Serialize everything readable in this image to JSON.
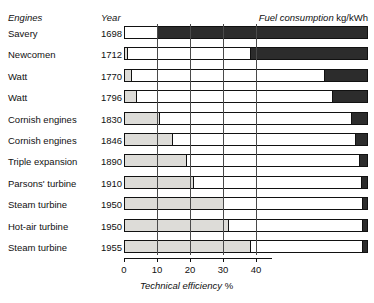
{
  "header": {
    "engines": "Engines",
    "year": "Year",
    "fuel_consumption": "Fuel consumption",
    "fuel_unit": "kg/kWh"
  },
  "axis": {
    "title": "Technical efficiency",
    "title_unit": "%",
    "ticks": [
      0,
      10,
      20,
      30,
      40
    ],
    "min": 0,
    "max": 40
  },
  "chart_data": {
    "type": "bar",
    "orientation": "horizontal",
    "stacked": true,
    "title": "",
    "subtitle": "",
    "xlabel": "Technical efficiency %",
    "ylabel": "Engines",
    "xlim": [
      0,
      74
    ],
    "xticks": [
      0,
      10,
      20,
      30,
      40
    ],
    "grid": true,
    "legend_position": "none",
    "annotations": [
      "Engines",
      "Year",
      "Fuel consumption kg/kWh"
    ],
    "categories": [
      "Savery",
      "Newcomen",
      "Watt",
      "Watt",
      "Cornish engines",
      "Cornish engines",
      "Triple expansion",
      "Parsons' turbine",
      "Steam turbine",
      "Hot-air turbine",
      "Steam turbine"
    ],
    "years": [
      1698,
      1712,
      1770,
      1796,
      1830,
      1846,
      1890,
      1910,
      1950,
      1950,
      1955
    ],
    "series": [
      {
        "name": "Technical efficiency %",
        "color": "#dddcd8",
        "values": [
          0.0,
          0.5,
          2.0,
          3.5,
          10.5,
          14.5,
          19.0,
          21.0,
          30.0,
          31.5,
          38.0
        ]
      },
      {
        "name": "Fuel consumption kg/kWh",
        "color": "#2c2c2c",
        "values": [
          63.0,
          35.0,
          13.0,
          10.5,
          5.5,
          4.5,
          3.0,
          2.0,
          1.5,
          1.5,
          1.5
        ]
      }
    ],
    "bars": [
      {
        "label": "Savery",
        "year": "1698",
        "efficiency": 0.0,
        "efficiency_px": 0,
        "white_end_px": 34,
        "loss_px": 210
      },
      {
        "label": "Newcomen",
        "year": "1712",
        "efficiency": 0.5,
        "efficiency_px": 3,
        "white_end_px": 127,
        "loss_px": 117
      },
      {
        "label": "Watt",
        "year": "1770",
        "efficiency": 2.0,
        "efficiency_px": 7,
        "white_end_px": 201,
        "loss_px": 43
      },
      {
        "label": "Watt",
        "year": "1796",
        "efficiency": 3.5,
        "efficiency_px": 12,
        "white_end_px": 209,
        "loss_px": 35
      },
      {
        "label": "Cornish engines",
        "year": "1830",
        "efficiency": 10.5,
        "efficiency_px": 35,
        "white_end_px": 228,
        "loss_px": 16
      },
      {
        "label": "Cornish engines",
        "year": "1846",
        "efficiency": 14.5,
        "efficiency_px": 48,
        "white_end_px": 232,
        "loss_px": 12
      },
      {
        "label": "Triple expansion",
        "year": "1890",
        "efficiency": 19.0,
        "efficiency_px": 62,
        "white_end_px": 236,
        "loss_px": 8
      },
      {
        "label": "Parsons' turbine",
        "year": "1910",
        "efficiency": 21.0,
        "efficiency_px": 69,
        "white_end_px": 238,
        "loss_px": 6
      },
      {
        "label": "Steam turbine",
        "year": "1950",
        "efficiency": 30.0,
        "efficiency_px": 99,
        "white_end_px": 239,
        "loss_px": 5
      },
      {
        "label": "Hot-air turbine",
        "year": "1950",
        "efficiency": 31.5,
        "efficiency_px": 104,
        "white_end_px": 239,
        "loss_px": 5
      },
      {
        "label": "Steam turbine",
        "year": "1955",
        "efficiency": 38.0,
        "efficiency_px": 126,
        "white_end_px": 239,
        "loss_px": 5
      }
    ]
  }
}
